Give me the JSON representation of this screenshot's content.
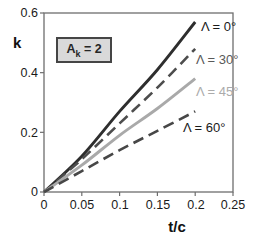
{
  "chart_data": {
    "type": "line",
    "title": "",
    "xlabel": "t/c",
    "ylabel": "k",
    "xlim": [
      0,
      0.25
    ],
    "ylim": [
      0,
      0.6
    ],
    "grid": false,
    "legend_position": "inline-labels-right",
    "x_ticks": [
      0,
      0.05,
      0.1,
      0.15,
      0.2,
      0.25
    ],
    "x_tick_labels": [
      "0",
      "0.05",
      "0.1",
      "0.15",
      "0.2",
      "0.25"
    ],
    "y_ticks": [
      0,
      0.2,
      0.4,
      0.6
    ],
    "y_tick_labels": [
      "0",
      "0.2",
      "0.4",
      "0.6"
    ],
    "annotation": {
      "prefix": "A",
      "sub": "k",
      "rest": " = 2",
      "fill": "#d9d9d9",
      "border": "#454545"
    },
    "series": [
      {
        "name": "Lambda = 0 deg",
        "label": "Λ = 0°",
        "style": "solid",
        "color": "#2e2e2e",
        "label_color": "#1a1a1a",
        "x": [
          0,
          0.05,
          0.1,
          0.15,
          0.2
        ],
        "values": [
          0,
          0.12,
          0.27,
          0.41,
          0.57
        ]
      },
      {
        "name": "Lambda = 30 deg",
        "label": "Λ = 30°",
        "style": "dashed",
        "color": "#4d4d4d",
        "label_color": "#595959",
        "x": [
          0,
          0.05,
          0.1,
          0.15,
          0.2
        ],
        "values": [
          0,
          0.11,
          0.23,
          0.35,
          0.48
        ]
      },
      {
        "name": "Lambda = 45 deg",
        "label": "Λ = 45°",
        "style": "solid",
        "color": "#a9a9a9",
        "label_color": "#ababab",
        "x": [
          0,
          0.05,
          0.1,
          0.15,
          0.2
        ],
        "values": [
          0,
          0.09,
          0.19,
          0.28,
          0.38
        ]
      },
      {
        "name": "Lambda = 60 deg",
        "label": "Λ = 60°",
        "style": "dashed",
        "color": "#474747",
        "label_color": "#1a1a1a",
        "x": [
          0,
          0.05,
          0.1,
          0.15,
          0.2
        ],
        "values": [
          0,
          0.07,
          0.14,
          0.205,
          0.27
        ]
      }
    ],
    "axis_color": "#6e6e6e"
  }
}
